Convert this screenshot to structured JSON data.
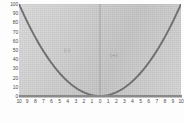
{
  "chart_data": {
    "type": "line",
    "title": "",
    "subtitle": "",
    "xlabel": "",
    "ylabel": "",
    "xlim": [
      -10,
      10
    ],
    "ylim": [
      0,
      100
    ],
    "grid": false,
    "legend": null,
    "series": [
      {
        "name": "y = x^2",
        "color": "#6f6f6f",
        "x": [
          -10,
          -9,
          -8,
          -7,
          -6,
          -5,
          -4,
          -3,
          -2,
          -1,
          0,
          1,
          2,
          3,
          4,
          5,
          6,
          7,
          8,
          9,
          10
        ],
        "values": [
          100,
          81,
          64,
          49,
          36,
          25,
          16,
          9,
          4,
          1,
          0,
          1,
          4,
          9,
          16,
          25,
          36,
          49,
          64,
          81,
          100
        ]
      }
    ],
    "x_tick_labels": [
      "10",
      "9",
      "8",
      "7",
      "6",
      "5",
      "4",
      "3",
      "2",
      "1",
      "0",
      "1",
      "2",
      "3",
      "4",
      "5",
      "6",
      "7",
      "8",
      "9",
      "10"
    ],
    "x_tick_values": [
      -10,
      -9,
      -8,
      -7,
      -6,
      -5,
      -4,
      -3,
      -2,
      -1,
      0,
      1,
      2,
      3,
      4,
      5,
      6,
      7,
      8,
      9,
      10
    ],
    "y_tick_labels": [
      "100",
      "90",
      "80",
      "70",
      "60",
      "50",
      "40",
      "30",
      "20",
      "10",
      "0"
    ],
    "y_tick_values": [
      100,
      90,
      80,
      70,
      60,
      50,
      40,
      30,
      20,
      10,
      0
    ],
    "annotations": [
      {
        "text": "(-)",
        "x": -4.0,
        "y": 52,
        "name": "region-negative"
      },
      {
        "text": "(+)",
        "x": 1.8,
        "y": 46,
        "name": "region-positive"
      }
    ],
    "axis_vertical_at_x": 0,
    "plot_background": "#cfcfcf",
    "curve_color": "#6f6f6f",
    "axis_color": "#8a8a8a",
    "tick_label_color": "#4a4a4a",
    "annotation_color": "#8d8d8d"
  }
}
